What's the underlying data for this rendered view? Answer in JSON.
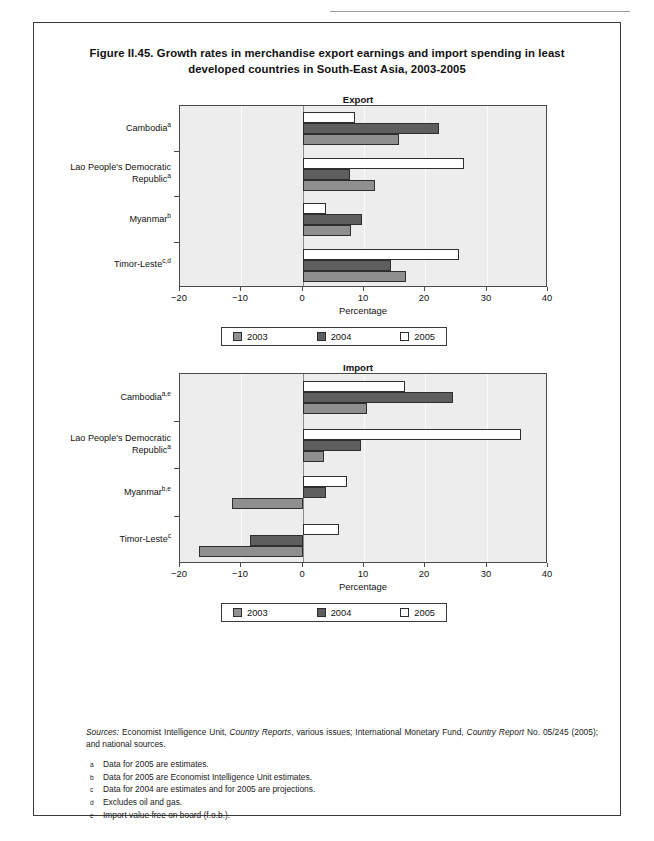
{
  "figure": {
    "title_line1": "Figure II.45. Growth rates in merchandise export earnings and import spending in",
    "title_line2": "least developed countries in South-East Asia, 2003-2005",
    "title_prefix_italic": "II.45."
  },
  "legend": {
    "items": [
      {
        "label": "2003",
        "color": "#8f8f8f"
      },
      {
        "label": "2004",
        "color": "#5e5e5e"
      },
      {
        "label": "2005",
        "color": "#ffffff"
      }
    ]
  },
  "axis": {
    "xlabel": "Percentage",
    "ticks": [
      "−20",
      "−10",
      "0",
      "10",
      "20",
      "30",
      "40"
    ],
    "tick_values": [
      -20,
      -10,
      0,
      10,
      20,
      30,
      40
    ]
  },
  "notes": {
    "sources_label": "Sources:",
    "sources_text_1": "Economist Intelligence Unit,",
    "sources_italic_1": "Country Reports",
    "sources_text_2": ", various issues; International Monetary Fund,",
    "sources_italic_2": "Country Report",
    "sources_text_3": "No. 05/245 (2005); and national sources.",
    "footnotes": [
      {
        "mark": "a",
        "text": "Data for 2005 are estimates."
      },
      {
        "mark": "b",
        "text": "Data for 2005 are Economist Intelligence Unit estimates."
      },
      {
        "mark": "c",
        "text": "Data for 2004 are estimates and for 2005 are projections."
      },
      {
        "mark": "d",
        "text": "Excludes oil and gas."
      },
      {
        "mark": "e",
        "text": "Import value free on board (f.o.b.)."
      }
    ]
  },
  "chart_data": [
    {
      "type": "bar",
      "orientation": "horizontal",
      "title": "Export",
      "xlabel": "Percentage",
      "ylabel": "",
      "xlim": [
        -20,
        40
      ],
      "xticks": [
        -20,
        -10,
        0,
        10,
        20,
        30,
        40
      ],
      "grid": true,
      "legend_position": "below",
      "categories": [
        {
          "name": "Cambodia",
          "sup": "a"
        },
        {
          "name": "Lao People's Democratic Republic",
          "sup": "a"
        },
        {
          "name": "Myanmar",
          "sup": "b"
        },
        {
          "name": "Timor-Leste",
          "sup": "c,d"
        }
      ],
      "category_labels": [
        "Cambodiaᵃ",
        "Lao People's Democratic Republicᵃ",
        "Myanmarᵇ",
        "Timor-Lesteᶜᵈ"
      ],
      "series": [
        {
          "name": "2003",
          "values": [
            15.6,
            11.8,
            7.8,
            16.8
          ]
        },
        {
          "name": "2004",
          "values": [
            22.2,
            7.7,
            9.6,
            14.4
          ]
        },
        {
          "name": "2005",
          "values": [
            8.5,
            26.3,
            3.8,
            25.4
          ]
        }
      ]
    },
    {
      "type": "bar",
      "orientation": "horizontal",
      "title": "Import",
      "xlabel": "Percentage",
      "ylabel": "",
      "xlim": [
        -20,
        40
      ],
      "xticks": [
        -20,
        -10,
        0,
        10,
        20,
        30,
        40
      ],
      "grid": true,
      "legend_position": "below",
      "categories": [
        {
          "name": "Cambodia",
          "sup": "a,e"
        },
        {
          "name": "Lao People's Democratic Republic",
          "sup": "a"
        },
        {
          "name": "Myanmar",
          "sup": "b,e"
        },
        {
          "name": "Timor-Leste",
          "sup": "c"
        }
      ],
      "category_labels": [
        "Cambodiaᵃᵉ",
        "Lao People's Democratic Republicᵃ",
        "Myanmarᵇᵉ",
        "Timor-Lesteᶜ"
      ],
      "series": [
        {
          "name": "2003",
          "values": [
            10.4,
            3.5,
            -11.6,
            -16.9
          ]
        },
        {
          "name": "2004",
          "values": [
            24.4,
            9.5,
            3.7,
            -8.6
          ]
        },
        {
          "name": "2005",
          "values": [
            16.6,
            35.5,
            7.2,
            5.9
          ]
        }
      ]
    }
  ],
  "panels": {
    "export": {
      "title": "Export",
      "cat_lines": [
        [
          "Cambodia"
        ],
        [
          "Lao People's Democratic",
          "Republic"
        ],
        [
          "Myanmar"
        ],
        [
          "Timor-Leste"
        ]
      ],
      "cat_sups": [
        "a",
        "a",
        "b",
        "c,d"
      ]
    },
    "import": {
      "title": "Import",
      "cat_lines": [
        [
          "Cambodia"
        ],
        [
          "Lao People's Democratic",
          "Republic"
        ],
        [
          "Myanmar"
        ],
        [
          "Timor-Leste"
        ]
      ],
      "cat_sups": [
        "a,e",
        "a",
        "b,e",
        "c"
      ]
    }
  }
}
